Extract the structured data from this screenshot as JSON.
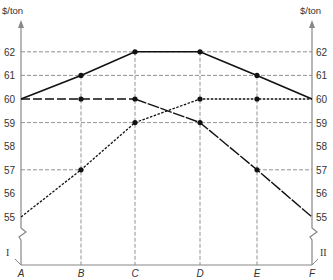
{
  "chart_data": {
    "type": "line",
    "title": "",
    "xlabel": "",
    "ylabel": "$/ton",
    "ylabel_right": "$/ton",
    "categories": [
      "A",
      "B",
      "C",
      "D",
      "E",
      "F"
    ],
    "y_ticks": [
      55,
      56,
      57,
      58,
      59,
      60,
      61,
      62
    ],
    "ylim": [
      55,
      62
    ],
    "left_axis_label": "I",
    "right_axis_label": "II",
    "grid": "partial dashed reference lines",
    "series": [
      {
        "name": "upper (solid)",
        "style": "solid",
        "values": [
          60,
          61,
          62,
          62,
          61,
          60
        ]
      },
      {
        "name": "falling (dashed then solid)",
        "style": "dash",
        "values": [
          60,
          60,
          60,
          59,
          57,
          55
        ]
      },
      {
        "name": "rising (dotted)",
        "style": "dot",
        "values": [
          55,
          57,
          59,
          60,
          60,
          60
        ]
      }
    ]
  },
  "axis": {
    "left_unit": "$/ton",
    "right_unit": "$/ton",
    "left_roman": "I",
    "right_roman": "II",
    "ticks": [
      "62",
      "61",
      "60",
      "59",
      "58",
      "57",
      "56",
      "55"
    ],
    "x_labels": [
      "A",
      "B",
      "C",
      "D",
      "E",
      "F"
    ]
  }
}
